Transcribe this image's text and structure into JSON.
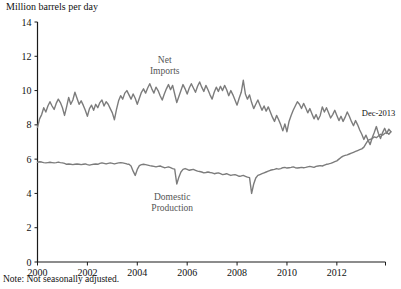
{
  "chart_data": {
    "type": "line",
    "title": "",
    "ylabel": "Million barrels per day",
    "xlabel": "",
    "note": "Note: Not seasonally adjusted.",
    "ylim": [
      0,
      14
    ],
    "xlim": [
      2000.0,
      2013.95
    ],
    "yticks": [
      0,
      2,
      4,
      6,
      8,
      10,
      12,
      14
    ],
    "ytick_labels": [
      "0",
      "2",
      "4",
      "6",
      "8",
      "10",
      "12",
      "14"
    ],
    "xticks": [
      2000,
      2002,
      2004,
      2006,
      2008,
      2010,
      2012
    ],
    "xtick_labels": [
      "2000",
      "2002",
      "2004",
      "2006",
      "2008",
      "2010",
      "2012"
    ],
    "grid": false,
    "legend_position": "inline-annotation",
    "line_color": "#7c7c7c",
    "axis_color": "#1a1a1a",
    "annotations": [
      {
        "name": "net-imports-label",
        "text": "Net\nImports",
        "line1": "Net",
        "line2": "Imports",
        "x": 2005.1,
        "y": 11.6
      },
      {
        "name": "domestic-production-label",
        "text": "Domestic\nProduction",
        "line1": "Domestic",
        "line2": "Production",
        "x": 2005.4,
        "y": 3.6
      },
      {
        "name": "last-point-callout",
        "text": "Dec-2013",
        "x": 2013.0,
        "y": 8.5
      }
    ],
    "series": [
      {
        "name": "Net Imports",
        "x_start": 2000.0,
        "x_step": 0.0833333,
        "values": [
          7.85,
          8.35,
          8.6,
          9.0,
          8.75,
          9.1,
          9.35,
          9.1,
          8.9,
          9.25,
          9.5,
          9.3,
          9.0,
          8.55,
          9.05,
          9.6,
          9.2,
          9.45,
          9.9,
          9.55,
          9.2,
          9.4,
          9.15,
          8.85,
          8.5,
          8.95,
          9.15,
          8.85,
          9.2,
          9.0,
          9.3,
          9.45,
          9.1,
          9.35,
          9.2,
          8.95,
          8.7,
          8.3,
          8.9,
          9.4,
          9.7,
          9.5,
          9.85,
          10.0,
          9.75,
          9.5,
          9.8,
          9.55,
          9.2,
          9.55,
          9.9,
          10.1,
          9.85,
          10.15,
          10.4,
          10.1,
          9.85,
          10.2,
          10.0,
          9.7,
          9.45,
          9.8,
          10.1,
          10.35,
          10.05,
          10.3,
          9.8,
          9.3,
          9.65,
          10.0,
          10.35,
          10.1,
          9.8,
          10.15,
          10.4,
          10.15,
          9.9,
          10.25,
          10.5,
          10.2,
          9.95,
          10.3,
          10.05,
          9.75,
          9.5,
          9.9,
          10.2,
          9.95,
          10.25,
          10.0,
          10.3,
          10.05,
          9.7,
          10.0,
          9.75,
          9.45,
          9.15,
          9.55,
          9.9,
          10.6,
          9.8,
          9.5,
          9.75,
          9.3,
          8.95,
          9.2,
          9.45,
          9.15,
          8.85,
          9.1,
          8.8,
          9.05,
          8.75,
          8.45,
          8.2,
          8.55,
          8.3,
          8.0,
          7.65,
          8.05,
          7.6,
          8.2,
          8.55,
          8.85,
          9.1,
          9.35,
          9.2,
          8.95,
          9.25,
          9.0,
          8.7,
          8.95,
          8.65,
          8.35,
          8.6,
          8.3,
          8.55,
          9.05,
          8.75,
          9.0,
          8.7,
          8.4,
          8.6,
          8.85,
          8.55,
          8.25,
          8.5,
          8.2,
          8.45,
          8.75,
          8.5,
          8.2,
          7.95,
          8.25,
          8.0,
          7.7,
          7.45,
          7.15,
          7.4,
          7.1,
          6.85,
          7.25,
          7.55,
          7.9,
          7.5,
          7.2,
          7.55,
          7.8,
          7.5,
          7.75,
          7.6
        ]
      },
      {
        "name": "Domestic Production",
        "x_start": 2000.0,
        "x_step": 0.0833333,
        "values": [
          5.82,
          5.85,
          5.83,
          5.8,
          5.78,
          5.8,
          5.82,
          5.8,
          5.78,
          5.8,
          5.83,
          5.8,
          5.78,
          5.75,
          5.7,
          5.72,
          5.7,
          5.68,
          5.7,
          5.72,
          5.7,
          5.68,
          5.7,
          5.72,
          5.68,
          5.65,
          5.68,
          5.7,
          5.72,
          5.7,
          5.75,
          5.78,
          5.75,
          5.72,
          5.75,
          5.78,
          5.75,
          5.72,
          5.75,
          5.78,
          5.8,
          5.78,
          5.75,
          5.72,
          5.7,
          5.6,
          5.3,
          5.05,
          5.4,
          5.62,
          5.68,
          5.7,
          5.68,
          5.65,
          5.62,
          5.6,
          5.58,
          5.55,
          5.58,
          5.6,
          5.55,
          5.5,
          5.52,
          5.55,
          5.5,
          5.45,
          5.42,
          4.55,
          4.95,
          5.25,
          5.4,
          5.45,
          5.4,
          5.35,
          5.38,
          5.4,
          5.35,
          5.3,
          5.28,
          5.25,
          5.2,
          5.22,
          5.25,
          5.22,
          5.2,
          5.15,
          5.18,
          5.2,
          5.15,
          5.1,
          5.12,
          5.15,
          5.1,
          5.05,
          5.08,
          5.1,
          5.05,
          5.0,
          5.02,
          5.05,
          5.0,
          4.95,
          4.92,
          4.0,
          4.55,
          4.9,
          5.05,
          5.1,
          5.15,
          5.2,
          5.25,
          5.3,
          5.35,
          5.38,
          5.4,
          5.45,
          5.42,
          5.45,
          5.5,
          5.52,
          5.48,
          5.5,
          5.52,
          5.55,
          5.5,
          5.48,
          5.5,
          5.52,
          5.5,
          5.52,
          5.55,
          5.58,
          5.55,
          5.52,
          5.58,
          5.6,
          5.62,
          5.6,
          5.65,
          5.7,
          5.72,
          5.75,
          5.8,
          5.85,
          5.9,
          6.0,
          6.1,
          6.18,
          6.22,
          6.25,
          6.3,
          6.35,
          6.4,
          6.45,
          6.5,
          6.55,
          6.6,
          6.7,
          6.9,
          7.1,
          7.15,
          7.2,
          7.3,
          7.25,
          7.35,
          7.45,
          7.4,
          7.5,
          7.55,
          7.45,
          7.6
        ]
      }
    ]
  }
}
